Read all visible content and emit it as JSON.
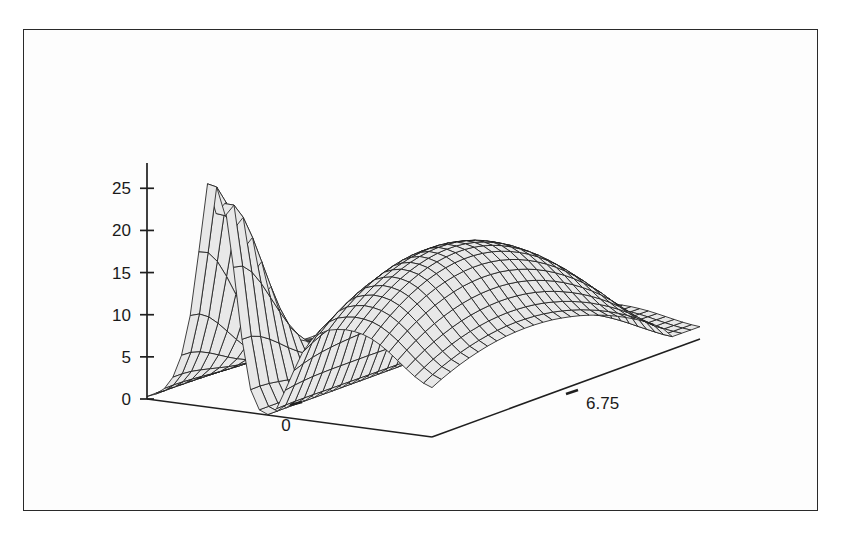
{
  "figure": {
    "background_color": "#fdfdfd",
    "frame_color": "#2a2a2a",
    "ink_color": "#1f1f1f",
    "surface_fill": "#e8e8e8",
    "width": 844,
    "height": 536
  },
  "chart_data": {
    "type": "line",
    "render": "3d-wireframe-surface",
    "title": "",
    "subtitle": "",
    "xlabel": "",
    "ylabel": "",
    "zlabel": "",
    "grid": false,
    "legend": null,
    "legend_position": "none",
    "projection": "oblique-parallel",
    "z_axis": {
      "ticks": [
        0,
        5,
        10,
        15,
        20,
        25
      ],
      "tick_labels": [
        "0",
        "5",
        "10",
        "15",
        "20",
        "25"
      ],
      "zlim": [
        0,
        28
      ],
      "axis_top_value": 28
    },
    "x_axis": {
      "tick_labels": [
        "0"
      ],
      "ticks": [
        0
      ],
      "xlim": [
        -2.5,
        9.0
      ]
    },
    "y_axis": {
      "tick_labels": [
        "6.75"
      ],
      "ticks": [
        6.75
      ],
      "ylim": [
        0,
        13.5
      ]
    },
    "annotations": [
      {
        "text": "0",
        "axis": "x"
      },
      {
        "text": "6.75",
        "axis": "y"
      }
    ],
    "mesh": {
      "nx": 34,
      "ny": 30
    },
    "features": [
      {
        "name": "peak-left",
        "z": 28
      },
      {
        "name": "peak-right",
        "z": 26
      },
      {
        "name": "saddle",
        "z": 23
      },
      {
        "name": "valley-floor",
        "z": 0
      },
      {
        "name": "broad-ridge",
        "z": 17
      },
      {
        "name": "right-edge-height",
        "z": 9
      }
    ],
    "x": [
      -2.5,
      -2.1,
      -1.8,
      -1.4,
      -1.1,
      -0.7,
      -0.4,
      0.0,
      0.4,
      0.7,
      1.1,
      1.4,
      1.8,
      2.1,
      2.5,
      2.8,
      3.2,
      3.5,
      3.9,
      4.2,
      4.6,
      4.9,
      5.3,
      5.6,
      6.0,
      6.4,
      6.7,
      7.1,
      7.4,
      7.8,
      8.1,
      8.5,
      8.8,
      9.0
    ],
    "values": [
      0.4,
      0.9,
      1.8,
      3.4,
      6.2,
      11.0,
      18.5,
      26.5,
      23.2,
      25.0,
      18.0,
      9.5,
      3.2,
      0.6,
      0.1,
      1.2,
      4.5,
      8.2,
      11.8,
      14.3,
      15.9,
      16.8,
      17.2,
      17.4,
      17.3,
      17.0,
      16.4,
      15.5,
      14.4,
      13.1,
      11.8,
      10.6,
      9.6,
      9.0
    ]
  }
}
